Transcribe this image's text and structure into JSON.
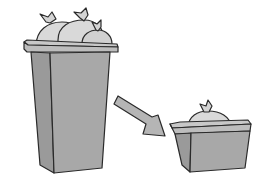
{
  "illustration": {
    "description": "Large overflowing trash bin with an arrow pointing to a small trash bin holding a single bag",
    "alt_text": "Reduce waste: large bin to small bin",
    "elements": {
      "large_bin": {
        "bags": 3
      },
      "arrow": {
        "direction": "down-right"
      },
      "small_bin": {
        "bags": 1
      }
    },
    "colors": {
      "bin_body": "#a8a8a8",
      "bin_side": "#9a9a9a",
      "bin_rim": "#bdbdbd",
      "bag": "#d9d9d9",
      "bag_shadow": "#c6c6c6",
      "arrow": "#b5b5b5",
      "outline": "#2a2a2a",
      "background": "#ffffff"
    }
  }
}
